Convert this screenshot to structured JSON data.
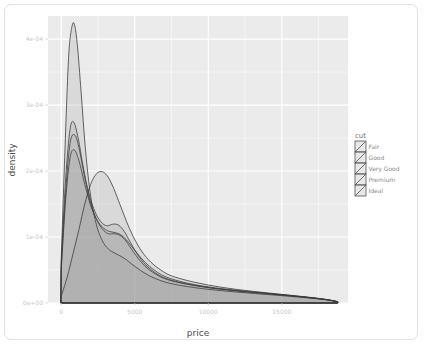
{
  "chart_data": {
    "type": "line",
    "title": "",
    "subtitle": "",
    "xlabel": "price",
    "ylabel": "density",
    "xlim": [
      -900,
      19500
    ],
    "ylim": [
      0,
      0.000435
    ],
    "grid": true,
    "legend_position": "right",
    "legend_title": "cut",
    "x_ticks": [
      0,
      5000,
      10000,
      15000
    ],
    "x_tick_labels": [
      "0",
      "5000",
      "10000",
      "15000"
    ],
    "y_ticks": [
      0,
      0.0001,
      0.0002,
      0.0003,
      0.0004
    ],
    "y_tick_labels": [
      "0e+00",
      "1e-04",
      "2e-04",
      "3e-04",
      "4e-04"
    ],
    "fill_alpha": 0.22,
    "panel_background": "#ebebeb",
    "gridline_color": "#ffffff",
    "line_color": "#3a3a3a",
    "fill_color": "#9a9a9a",
    "series": [
      {
        "name": "Fair",
        "peak_x": 2800,
        "peak_y": 0.000199,
        "x": [
          0,
          400,
          800,
          1200,
          1600,
          2000,
          2400,
          2800,
          3200,
          3600,
          4000,
          4600,
          5200,
          5800,
          6400,
          7200,
          8000,
          9000,
          10000,
          11000,
          12000,
          13000,
          14000,
          15000,
          16000,
          17000,
          18000,
          18800
        ],
        "values": [
          1.05e-05,
          3.9e-05,
          7.45e-05,
          0.000111,
          0.00015,
          0.00018,
          0.000196,
          0.000199,
          0.0001905,
          0.000172,
          0.000149,
          0.000115,
          8.8e-05,
          6.9e-05,
          5.6e-05,
          4.4e-05,
          3.75e-05,
          3.18e-05,
          2.72e-05,
          2.35e-05,
          2.04e-05,
          1.78e-05,
          1.54e-05,
          1.31e-05,
          1.08e-05,
          8.4e-06,
          5.5e-06,
          2e-06
        ]
      },
      {
        "name": "Good",
        "peak_x": 900,
        "peak_y": 0.000255,
        "x": [
          0,
          300,
          600,
          900,
          1200,
          1600,
          2000,
          2400,
          2800,
          3200,
          3600,
          4000,
          4400,
          4800,
          5400,
          6000,
          6800,
          7600,
          8600,
          9600,
          10800,
          12000,
          13200,
          14400,
          15600,
          16800,
          18000,
          18800
        ],
        "values": [
          5.6e-05,
          0.000168,
          0.000242,
          0.000255,
          0.000236,
          0.00019,
          0.000151,
          0.000127,
          0.000112,
          0.000105,
          0.000105,
          0.0001025,
          9.4e-05,
          8.1e-05,
          6.3e-05,
          5e-05,
          3.92e-05,
          3.3e-05,
          2.82e-05,
          2.45e-05,
          2.1e-05,
          1.82e-05,
          1.58e-05,
          1.34e-05,
          1.1e-05,
          8.3e-06,
          5.2e-06,
          2e-06
        ]
      },
      {
        "name": "Very Good",
        "peak_x": 850,
        "peak_y": 0.000274,
        "x": [
          0,
          300,
          600,
          850,
          1150,
          1500,
          1900,
          2300,
          2700,
          3100,
          3500,
          3900,
          4300,
          4700,
          5300,
          5900,
          6700,
          7500,
          8500,
          9500,
          10700,
          11900,
          13100,
          14300,
          15500,
          16700,
          18000,
          18800
        ],
        "values": [
          6.2e-05,
          0.000188,
          0.000263,
          0.000274,
          0.00025,
          0.000206,
          0.000164,
          0.000138,
          0.000123,
          0.000117,
          0.0001195,
          0.000118,
          0.000108,
          9.2e-05,
          7e-05,
          5.45e-05,
          4.15e-05,
          3.45e-05,
          2.92e-05,
          2.52e-05,
          2.14e-05,
          1.85e-05,
          1.6e-05,
          1.36e-05,
          1.11e-05,
          8.4e-06,
          5.2e-06,
          2e-06
        ]
      },
      {
        "name": "Premium",
        "peak_x": 880,
        "peak_y": 0.000232,
        "x": [
          0,
          300,
          600,
          880,
          1200,
          1600,
          2000,
          2400,
          2800,
          3200,
          3600,
          4000,
          4400,
          4800,
          5400,
          6000,
          6800,
          7600,
          8600,
          9600,
          10800,
          12000,
          13200,
          14400,
          15600,
          16800,
          18000,
          18800
        ],
        "values": [
          5e-05,
          0.000156,
          0.00022,
          0.000232,
          0.000216,
          0.00018,
          0.000148,
          0.000127,
          0.000115,
          0.000109,
          0.000107,
          0.000104,
          9.65e-05,
          8.55e-05,
          6.9e-05,
          5.55e-05,
          4.3e-05,
          3.58e-05,
          3e-05,
          2.58e-05,
          2.2e-05,
          1.9e-05,
          1.64e-05,
          1.39e-05,
          1.13e-05,
          8.6e-06,
          5.3e-06,
          2e-06
        ]
      },
      {
        "name": "Ideal",
        "peak_x": 900,
        "peak_y": 0.000422,
        "x": [
          0,
          250,
          500,
          720,
          900,
          1100,
          1350,
          1650,
          2000,
          2400,
          2800,
          3200,
          3600,
          4000,
          4400,
          4800,
          5400,
          6000,
          6800,
          7600,
          8600,
          9600,
          10800,
          12000,
          13200,
          14400,
          15600,
          16800,
          18000,
          18800
        ],
        "values": [
          6.8e-05,
          0.00023,
          0.000372,
          0.000418,
          0.000422,
          0.00039,
          0.00032,
          0.000232,
          0.000162,
          0.000118,
          9.4e-05,
          8.2e-05,
          7.6e-05,
          7.15e-05,
          6.6e-05,
          5.9e-05,
          4.92e-05,
          4.12e-05,
          3.36e-05,
          2.88e-05,
          2.48e-05,
          2.18e-05,
          1.89e-05,
          1.65e-05,
          1.43e-05,
          1.22e-05,
          1e-05,
          7.7e-06,
          4.9e-06,
          1.8e-06
        ]
      }
    ]
  },
  "legend": {
    "title": "cut",
    "items": [
      {
        "label": "Fair"
      },
      {
        "label": "Good"
      },
      {
        "label": "Very Good"
      },
      {
        "label": "Premium"
      },
      {
        "label": "Ideal"
      }
    ]
  },
  "axes": {
    "x_title": "price",
    "y_title": "density"
  }
}
